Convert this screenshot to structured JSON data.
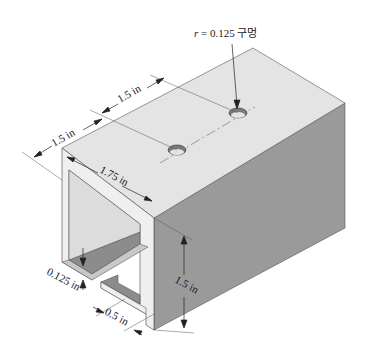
{
  "diagram": {
    "type": "isometric channel section with holes",
    "colors": {
      "top_face": "#e4e4e4",
      "right_face": "#9a9a9a",
      "inner_shadow": "#8c8c8c",
      "wall_edge": "#efefef",
      "line": "#333333",
      "hole": "#7a7a7a"
    },
    "labels": {
      "hole_callout_var": "r",
      "hole_callout_value": " = 0.125 구멍",
      "dim_spacing_1": "1.5 in",
      "dim_spacing_2": "1.5 in",
      "dim_width": "1.75 in",
      "dim_height": "1.5 in",
      "dim_thickness": "0.125 in",
      "dim_lip": "0.5 in"
    }
  }
}
